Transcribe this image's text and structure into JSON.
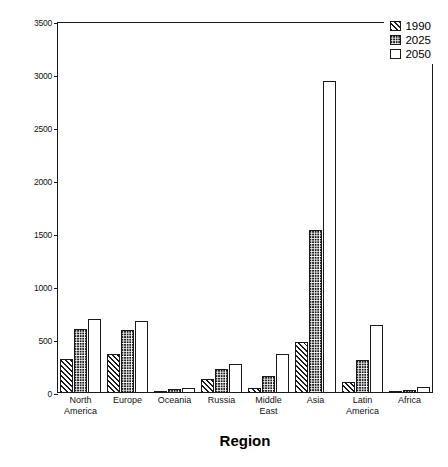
{
  "chart_data": {
    "type": "bar",
    "title": "",
    "xlabel": "Region",
    "ylabel": "Hip Fractures, in thousands",
    "categories": [
      "North America",
      "Europe",
      "Oceania",
      "Russia",
      "Middle East",
      "Asia",
      "Latin America",
      "Africa"
    ],
    "category_lines": [
      [
        "North",
        "America"
      ],
      [
        "Europe"
      ],
      [
        "Oceania"
      ],
      [
        "Russia"
      ],
      [
        "Middle",
        "East"
      ],
      [
        "Asia"
      ],
      [
        "Latin",
        "America"
      ],
      [
        "Africa"
      ]
    ],
    "series": [
      {
        "name": "1990",
        "pattern": "diagonal-hatch",
        "values": [
          320,
          370,
          20,
          130,
          45,
          480,
          105,
          12
        ]
      },
      {
        "name": "2025",
        "pattern": "dark-checker",
        "values": [
          600,
          590,
          35,
          225,
          160,
          1540,
          310,
          30
        ]
      },
      {
        "name": "2050",
        "pattern": "white-fill",
        "values": [
          700,
          680,
          50,
          275,
          365,
          2940,
          640,
          60
        ]
      }
    ],
    "ylim": [
      0,
      3500
    ],
    "yticks": [
      0,
      500,
      1000,
      1500,
      2000,
      2500,
      3000,
      3500
    ],
    "ytick_labels": [
      "0",
      "500",
      "1000",
      "1500",
      "2000",
      "2500",
      "3000",
      "3500"
    ],
    "grid": false,
    "legend_position": "top-right",
    "legend_entries": [
      "1990",
      "2025",
      "2050"
    ],
    "colors": {
      "ink": "#1a1a1a",
      "fill_2025": "#1a1a1a",
      "background": "#ffffff"
    }
  }
}
